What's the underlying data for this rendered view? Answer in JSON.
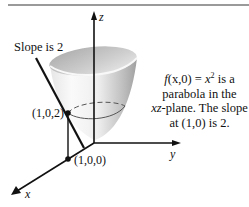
{
  "figure": {
    "slope_label": "Slope is 2",
    "axes": {
      "x": "x",
      "y": "y",
      "z": "z"
    },
    "points": {
      "p1": "(1,0,2)",
      "p2": "(1,0,0)"
    },
    "caption": {
      "func": "f",
      "args": "(x,0)",
      "eq": " = ",
      "var": "x",
      "exp": "2",
      "tail1": " is a",
      "line2": "parabola in the",
      "plane": "xz",
      "line3_rest": "-plane. The slope",
      "line4": "at (1,0) is 2."
    },
    "colors": {
      "ink": "#111111",
      "surface_light": "#f4f4f4",
      "surface_dark": "#a8a8a8",
      "rule": "#9a9a9a"
    }
  }
}
